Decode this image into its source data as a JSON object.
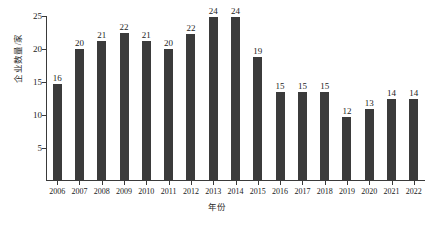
{
  "chart_data": {
    "type": "bar",
    "title": "",
    "xlabel": "年份",
    "ylabel": "企业数量/家",
    "categories": [
      "2006",
      "2007",
      "2008",
      "2009",
      "2010",
      "2011",
      "2012",
      "2013",
      "2014",
      "2015",
      "2016",
      "2017",
      "2018",
      "2019",
      "2020",
      "2021",
      "2022"
    ],
    "values": [
      16,
      20,
      21,
      22,
      21,
      20,
      22,
      24,
      24,
      19,
      15,
      15,
      15,
      12,
      13,
      14,
      14
    ],
    "bar_tops": [
      14.5,
      19.9,
      21.0,
      22.2,
      21.0,
      19.9,
      22.1,
      24.7,
      24.7,
      18.6,
      13.3,
      13.3,
      13.3,
      9.5,
      10.8,
      12.2,
      12.2
    ],
    "data_labels": [
      "16",
      "20",
      "21",
      "22",
      "21",
      "20",
      "22",
      "24",
      "24",
      "19",
      "15",
      "15",
      "15",
      "12",
      "13",
      "14",
      "14"
    ],
    "ylim": [
      0,
      25
    ],
    "yticks": [
      5,
      10,
      15,
      20,
      25
    ],
    "ytick_labels": [
      "5",
      "10",
      "15",
      "20",
      "25"
    ],
    "grid": false,
    "legend": false,
    "bar_color": "#3b3b3b",
    "axis_color": "#3a3a3a",
    "background": "#ffffff"
  }
}
